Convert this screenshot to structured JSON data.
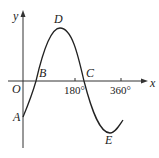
{
  "figure": {
    "type": "sine-like curve on coordinate axes",
    "axes": {
      "x_label": "x",
      "y_label": "y",
      "origin_label": "O",
      "x_ticks": [
        "180°",
        "360°"
      ]
    },
    "points": {
      "A": "A",
      "B": "B",
      "C": "C",
      "D": "D",
      "E": "E"
    },
    "colors": {
      "stroke": "#222222",
      "background": "#ffffff"
    }
  }
}
